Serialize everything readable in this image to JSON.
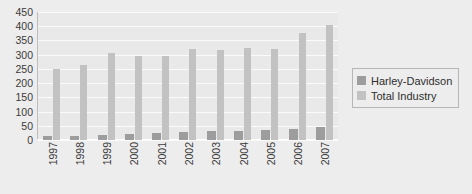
{
  "chart_data": {
    "type": "bar",
    "title": "",
    "subtitle": "",
    "xlabel": "",
    "ylabel": "",
    "ylim": [
      0,
      450
    ],
    "ytick_step": 50,
    "grid": true,
    "legend_position": "right",
    "categories": [
      "1997",
      "1998",
      "1999",
      "2000",
      "2001",
      "2002",
      "2003",
      "2004",
      "2005",
      "2006",
      "2007"
    ],
    "ytick_labels": [
      "450",
      "400",
      "350",
      "300",
      "250",
      "200",
      "150",
      "100",
      "50",
      "0"
    ],
    "ytick_values": [
      450,
      400,
      350,
      300,
      250,
      200,
      150,
      100,
      50,
      0
    ],
    "series": [
      {
        "name": "Harley-Davidson",
        "color": "#9d9d9d",
        "values": [
          13,
          15,
          18,
          21,
          24,
          28,
          30,
          33,
          35,
          40,
          45
        ]
      },
      {
        "name": "Total Industry",
        "color": "#c2c2c2",
        "values": [
          250,
          265,
          305,
          295,
          295,
          320,
          318,
          325,
          320,
          375,
          405
        ]
      }
    ]
  },
  "legend": {
    "items": [
      {
        "label": "Harley-Davidson",
        "color": "#9d9d9d"
      },
      {
        "label": "Total Industry",
        "color": "#c2c2c2"
      }
    ]
  },
  "colors": {
    "background": "#ededed",
    "plot_background": "#e9e9e9",
    "gridline": "#fafafa",
    "axis": "#bdbdbd",
    "text": "#3a3a3a",
    "harley_davidson": "#9d9d9d",
    "total_industry": "#c2c2c2"
  }
}
